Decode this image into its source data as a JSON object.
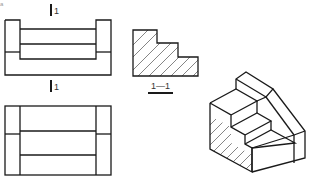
{
  "figure": {
    "corner_mark": "a",
    "cutting_plane_top_label": "1",
    "cutting_plane_bottom_label": "1",
    "section_label": "1—1",
    "views": [
      "front-view",
      "top-view",
      "section-view-1-1",
      "isometric-view"
    ]
  },
  "colors": {
    "line": "#1a1a1a",
    "background": "#ffffff"
  }
}
